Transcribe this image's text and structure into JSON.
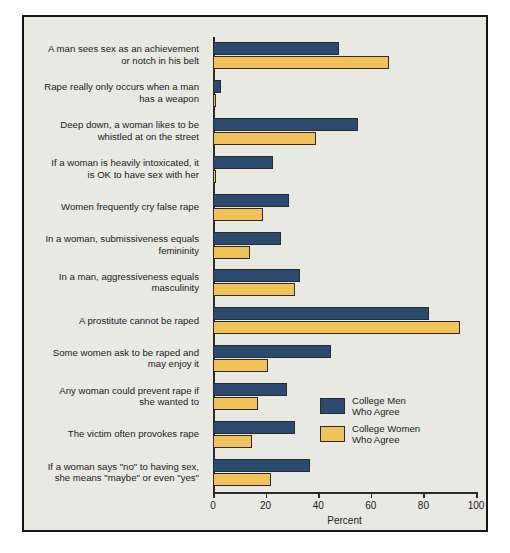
{
  "chart_data": {
    "type": "bar",
    "orientation": "horizontal",
    "title": "",
    "xlabel": "Percent",
    "ylabel": "",
    "xlim": [
      0,
      100
    ],
    "xticks": [
      0,
      20,
      40,
      60,
      80,
      100
    ],
    "grid": false,
    "legend_position": "inside-lower-right",
    "categories": [
      "A man sees sex as an achievement\nor notch in his belt",
      "Rape really only occurs when a man\nhas a weapon",
      "Deep down, a woman likes to be\nwhistled at on the street",
      "If a woman is heavily intoxicated, it\nis OK to have sex with her",
      "Women frequently cry false rape",
      "In a woman, submissiveness equals\nfemininity",
      "In a man, aggressiveness equals\nmasculinity",
      "A prostitute cannot be raped",
      "Some women ask to be raped and\nmay enjoy it",
      "Any woman could prevent rape if\nshe wanted to",
      "The victim often provokes rape",
      "If a woman says \"no\" to having sex,\nshe means \"maybe\" or even \"yes\""
    ],
    "series": [
      {
        "name": "College Men\nWho Agree",
        "color": "#2b4a70",
        "values": [
          48,
          3,
          55,
          23,
          29,
          26,
          33,
          82,
          45,
          28,
          31,
          37
        ]
      },
      {
        "name": "College Women\nWho Agree",
        "color": "#f2c257",
        "values": [
          67,
          1,
          39,
          1,
          19,
          14,
          31,
          94,
          21,
          17,
          15,
          22
        ]
      }
    ]
  },
  "legend": {
    "items": [
      {
        "label": "College Men\nWho Agree",
        "color": "#2b4a70"
      },
      {
        "label": "College Women\nWho Agree",
        "color": "#f2c257"
      }
    ]
  },
  "axis": {
    "x_title": "Percent",
    "tick_labels": [
      "0",
      "20",
      "40",
      "60",
      "80",
      "100"
    ]
  },
  "colors": {
    "background": "#e9e9e4",
    "frame_border": "#151515",
    "men": "#2b4a70",
    "women": "#f2c257",
    "text": "#1b1b1b"
  }
}
